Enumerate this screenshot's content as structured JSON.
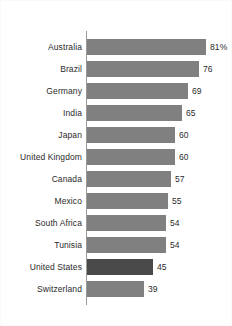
{
  "chart_data": {
    "type": "bar",
    "orientation": "horizontal",
    "title": "",
    "subtitle": "",
    "xlabel": "",
    "ylabel": "",
    "grid": false,
    "legend": false,
    "xlim": [
      0,
      81
    ],
    "categories": [
      "Australia",
      "Brazil",
      "Germany",
      "India",
      "Japan",
      "United Kingdom",
      "Canada",
      "Mexico",
      "South Africa",
      "Tunisia",
      "United States",
      "Switzerland"
    ],
    "values": [
      81,
      76,
      69,
      65,
      60,
      60,
      57,
      55,
      54,
      54,
      45,
      39
    ],
    "data_labels": [
      "81%",
      "76",
      "69",
      "65",
      "60",
      "60",
      "57",
      "55",
      "54",
      "54",
      "45",
      "39"
    ],
    "highlighted_category": "United States",
    "colors": {
      "bar": "#808080",
      "bar_highlight": "#4a4a4a",
      "axis": "#9a9a9a",
      "text": "#2b2b2b",
      "background": "#ffffff"
    }
  }
}
